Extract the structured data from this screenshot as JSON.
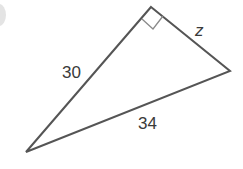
{
  "figure": {
    "type": "right-triangle",
    "vertices": {
      "right_angle": [
        151,
        7
      ],
      "right": [
        230,
        71
      ],
      "bottom_left": [
        26,
        152
      ]
    },
    "stroke_color": "#555555",
    "right_angle_marker": true,
    "labels": {
      "leg_left": "30",
      "hypotenuse": "34",
      "leg_right": "z"
    }
  }
}
